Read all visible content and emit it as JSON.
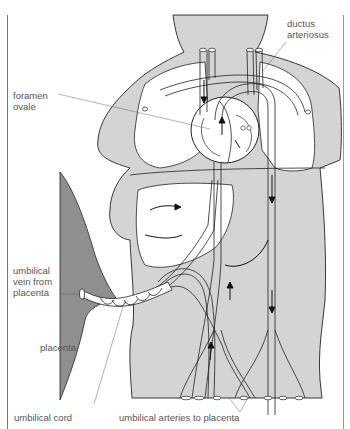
{
  "figure": {
    "colors": {
      "body_fill": "#d4d4d4",
      "placenta_fill": "#8f8f8f",
      "outline": "#222222",
      "label_text": "#555555",
      "background": "#ffffff"
    }
  },
  "labels": {
    "ductus_arteriosus": {
      "line1": "ductus",
      "line2": "arteriosus"
    },
    "foramen_ovale": {
      "line1": "foramen",
      "line2": "ovale"
    },
    "umbilical_vein": {
      "line1": "umbilical",
      "line2": "vein from",
      "line3": "placenta"
    },
    "placenta": "placenta",
    "umbilical_cord": "umbilical cord",
    "umbilical_arteries": "umbilical arteries to placenta"
  }
}
